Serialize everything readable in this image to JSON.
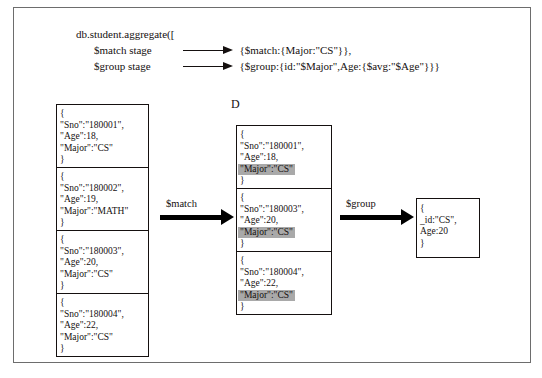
{
  "figure": {
    "marker": "D"
  },
  "code": {
    "call_line": "db.student.aggregate([",
    "stages": [
      {
        "label": "$match stage",
        "expression": "{$match:{Major:\"CS\"}},"
      },
      {
        "label": "$group stage",
        "expression": "{$group:{id:\"$Major\",Age:{$avg:\"$Age\"}}}"
      }
    ]
  },
  "input_collection": {
    "name": "student-input-documents",
    "documents": [
      {
        "lines": [
          {
            "text": "{",
            "highlight": false
          },
          {
            "text": "\"Sno\":\"180001\",",
            "highlight": false
          },
          {
            "text": "\"Age\":18,",
            "highlight": false
          },
          {
            "text": "\"Major\":\"CS\"",
            "highlight": false
          },
          {
            "text": "}",
            "highlight": false
          }
        ]
      },
      {
        "lines": [
          {
            "text": "{",
            "highlight": false
          },
          {
            "text": "\"Sno\":\"180002\",",
            "highlight": false
          },
          {
            "text": "\"Age\":19,",
            "highlight": false
          },
          {
            "text": "\"Major\":\"MATH\"",
            "highlight": false
          },
          {
            "text": "}",
            "highlight": false
          }
        ]
      },
      {
        "lines": [
          {
            "text": "{",
            "highlight": false
          },
          {
            "text": "\"Sno\":\"180003\",",
            "highlight": false
          },
          {
            "text": "\"Age\":20,",
            "highlight": false
          },
          {
            "text": "\"Major\":\"CS\"",
            "highlight": false
          },
          {
            "text": "}",
            "highlight": false
          }
        ]
      },
      {
        "lines": [
          {
            "text": "{",
            "highlight": false
          },
          {
            "text": "\"Sno\":\"180004\",",
            "highlight": false
          },
          {
            "text": "\"Age\":22,",
            "highlight": false
          },
          {
            "text": "\"Major\":\"CS\"",
            "highlight": false
          },
          {
            "text": "}",
            "highlight": false
          }
        ]
      }
    ]
  },
  "matched_collection": {
    "name": "matched-documents",
    "documents": [
      {
        "lines": [
          {
            "text": "{",
            "highlight": false
          },
          {
            "text": "\"Sno\":\"180001\",",
            "highlight": false
          },
          {
            "text": "\"Age\":18,",
            "highlight": false
          },
          {
            "text": "\"Major\":\"CS\"",
            "highlight": true
          },
          {
            "text": "}",
            "highlight": false
          }
        ]
      },
      {
        "lines": [
          {
            "text": "{",
            "highlight": false
          },
          {
            "text": "\"Sno\":\"180003\",",
            "highlight": false
          },
          {
            "text": "\"Age\":20,",
            "highlight": false
          },
          {
            "text": "\"Major\":\"CS\"",
            "highlight": true
          },
          {
            "text": "}",
            "highlight": false
          }
        ]
      },
      {
        "lines": [
          {
            "text": "{",
            "highlight": false
          },
          {
            "text": "\"Sno\":\"180004\",",
            "highlight": false
          },
          {
            "text": "\"Age\":22,",
            "highlight": false
          },
          {
            "text": "\"Major\":\"CS\"",
            "highlight": true
          },
          {
            "text": "}",
            "highlight": false
          }
        ]
      }
    ]
  },
  "result_collection": {
    "name": "grouped-result-document",
    "documents": [
      {
        "lines": [
          {
            "text": "{",
            "highlight": false
          },
          {
            "text": "_id:\"CS\",",
            "highlight": false
          },
          {
            "text": "Age:20",
            "highlight": false
          },
          {
            "text": "}",
            "highlight": false
          }
        ]
      }
    ]
  },
  "arrows": [
    {
      "name": "match",
      "label": "$match"
    },
    {
      "name": "group",
      "label": "$group"
    }
  ],
  "colors": {
    "highlight": "#a9a9a9",
    "ink": "#15100f",
    "frame": "#6d6d6d"
  }
}
